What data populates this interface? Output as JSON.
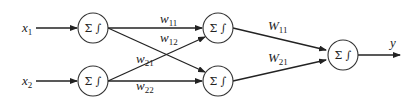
{
  "diagram": {
    "inputs": [
      {
        "label": "x",
        "sub": "1"
      },
      {
        "label": "x",
        "sub": "2"
      }
    ],
    "output": {
      "label": "y"
    },
    "node_symbol": "Σ ∫",
    "nodes": [
      {
        "id": "input-1",
        "layer": "input",
        "symbol": "Σ ∫"
      },
      {
        "id": "input-2",
        "layer": "input",
        "symbol": "Σ ∫"
      },
      {
        "id": "hidden-1",
        "layer": "hidden",
        "symbol": "Σ ∫"
      },
      {
        "id": "hidden-2",
        "layer": "hidden",
        "symbol": "Σ ∫"
      },
      {
        "id": "output",
        "layer": "output",
        "symbol": "Σ ∫"
      }
    ],
    "weights_layer1": [
      {
        "label": "w",
        "sub": "11",
        "from": "input-1",
        "to": "hidden-1"
      },
      {
        "label": "w",
        "sub": "12",
        "from": "input-1",
        "to": "hidden-2"
      },
      {
        "label": "w",
        "sub": "21",
        "from": "input-2",
        "to": "hidden-1"
      },
      {
        "label": "w",
        "sub": "22",
        "from": "input-2",
        "to": "hidden-2"
      }
    ],
    "weights_layer2": [
      {
        "label": "W",
        "sub": "11",
        "from": "hidden-1",
        "to": "output"
      },
      {
        "label": "W",
        "sub": "21",
        "from": "hidden-2",
        "to": "output"
      }
    ]
  }
}
